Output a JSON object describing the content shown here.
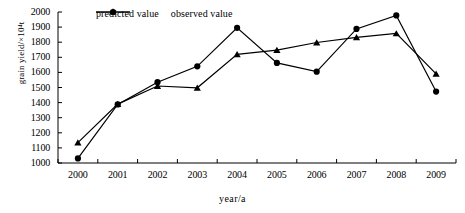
{
  "chart_data": {
    "type": "line",
    "title": "",
    "xlabel": "year/a",
    "ylabel": "grain yield/×10⁴t",
    "categories": [
      "2000",
      "2001",
      "2002",
      "2003",
      "2004",
      "2005",
      "2006",
      "2007",
      "2008",
      "2009"
    ],
    "xlim": [
      2000,
      2009
    ],
    "ylim": [
      1000,
      2000
    ],
    "ytick_labels": [
      "2000",
      "1900",
      "1800",
      "1700",
      "1600",
      "1500",
      "1400",
      "1300",
      "1200",
      "1100",
      "1000"
    ],
    "ytick_values": [
      2000,
      1900,
      1800,
      1700,
      1600,
      1500,
      1400,
      1300,
      1200,
      1100,
      1000
    ],
    "grid": false,
    "legend_position": "top-center",
    "series": [
      {
        "name": "predicted value",
        "marker": "circle",
        "color": "#000000",
        "values": [
          1030,
          1388,
          1535,
          1640,
          1895,
          1663,
          1605,
          1888,
          1977,
          1473
        ]
      },
      {
        "name": "observed value",
        "marker": "triangle",
        "color": "#000000",
        "values": [
          1135,
          1390,
          1510,
          1498,
          1720,
          1748,
          1798,
          1832,
          1858,
          1590
        ]
      }
    ]
  },
  "legend": {
    "items": [
      {
        "label": "predicted value",
        "marker": "circle-marker-icon"
      },
      {
        "label": "observed value",
        "marker": "triangle-marker-icon"
      }
    ]
  },
  "axes": {
    "x_title": "year/a",
    "y_title": "grain yield/×10⁴t"
  }
}
